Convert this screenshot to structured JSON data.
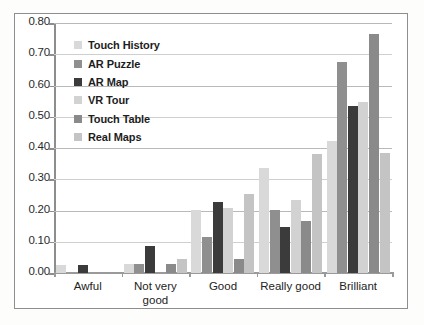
{
  "chart_data": {
    "type": "bar",
    "title": "",
    "xlabel": "",
    "ylabel": "",
    "ylim": [
      0.0,
      0.8
    ],
    "ytick_labels": [
      "0.00",
      "0.10",
      "0.20",
      "0.30",
      "0.40",
      "0.50",
      "0.60",
      "0.70",
      "0.80"
    ],
    "ytick_values": [
      0.0,
      0.1,
      0.2,
      0.3,
      0.4,
      0.5,
      0.6,
      0.7,
      0.8
    ],
    "grid": true,
    "legend_position": "upper-left-inside",
    "categories": [
      "Awful",
      "Not very\ngood",
      "Good",
      "Really good",
      "Brilliant"
    ],
    "series": [
      {
        "name": "Touch History",
        "color": "#d9d9d9",
        "values": [
          0.027,
          0.029,
          0.201,
          0.336,
          0.422
        ]
      },
      {
        "name": "AR Puzzle",
        "color": "#8f8f8f",
        "values": [
          0.0,
          0.03,
          0.116,
          0.203,
          0.674
        ]
      },
      {
        "name": "AR Map",
        "color": "#3b3b3b",
        "values": [
          0.027,
          0.086,
          0.227,
          0.146,
          0.534
        ]
      },
      {
        "name": "VR Tour",
        "color": "#d2d2d2",
        "values": [
          0.0,
          0.0,
          0.208,
          0.235,
          0.546
        ]
      },
      {
        "name": "Touch Table",
        "color": "#8a8a8a",
        "values": [
          0.0,
          0.028,
          0.046,
          0.166,
          0.766
        ]
      },
      {
        "name": "Real Maps",
        "color": "#c4c4c4",
        "values": [
          0.0,
          0.045,
          0.254,
          0.382,
          0.384
        ]
      }
    ]
  },
  "legend": {
    "items": [
      {
        "label": "Touch History"
      },
      {
        "label": "AR Puzzle"
      },
      {
        "label": "AR Map"
      },
      {
        "label": "VR Tour"
      },
      {
        "label": "Touch Table"
      },
      {
        "label": "Real Maps"
      }
    ]
  }
}
